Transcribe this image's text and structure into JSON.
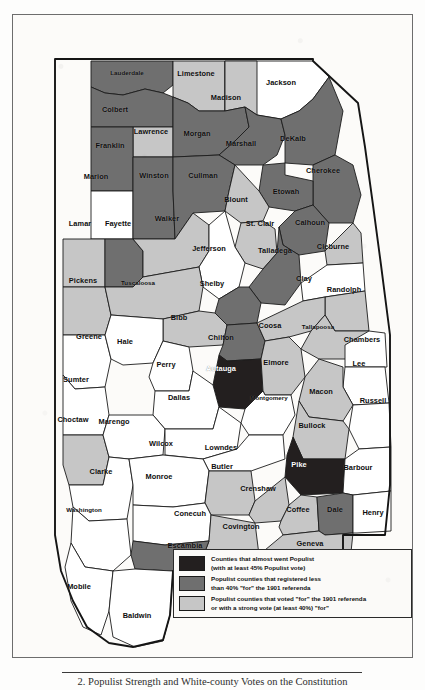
{
  "figure": {
    "caption": "2. Populist Strength and White-county Votes on the Constitution",
    "map_title": "Alabama counties — Populist strength and 1901 referenda"
  },
  "colors": {
    "almost_populist": "#231f1f",
    "populist_low_for": "#6f6f6f",
    "populist_voted_for": "#c6c6c6",
    "no_category": "#ffffff",
    "border": "#1c1c1c",
    "page_background": "#fdfdfc",
    "plate_background": "#fcfbf9"
  },
  "legend": {
    "items": [
      {
        "swatch": "almost_populist",
        "line1": "Counties that almost went Populist",
        "line2": "(with at least 45% Populist vote)"
      },
      {
        "swatch": "populist_low_for",
        "line1": "Populist counties that registered less",
        "line2": "than 40% \"for\" the 1901 referenda"
      },
      {
        "swatch": "populist_voted_for",
        "line1": "Populist counties that voted \"for\" the 1901 referenda",
        "line2": "or with a strong vote (at least 40%) \"for\""
      }
    ]
  },
  "counties": [
    {
      "name": "Lauderdale",
      "category": "populist_low_for",
      "lx": 114,
      "ly": 57
    },
    {
      "name": "Limestone",
      "category": "populist_voted_for",
      "lx": 183,
      "ly": 58
    },
    {
      "name": "Jackson",
      "category": "no_category",
      "lx": 268,
      "ly": 67
    },
    {
      "name": "Madison",
      "category": "populist_voted_for",
      "lx": 213,
      "ly": 82
    },
    {
      "name": "Colbert",
      "category": "populist_low_for",
      "lx": 102,
      "ly": 94
    },
    {
      "name": "Lawrence",
      "category": "populist_voted_for",
      "lx": 138,
      "ly": 116
    },
    {
      "name": "Morgan",
      "category": "populist_low_for",
      "lx": 184,
      "ly": 118
    },
    {
      "name": "Marshall",
      "category": "populist_low_for",
      "lx": 228,
      "ly": 128
    },
    {
      "name": "DeKalb",
      "category": "populist_low_for",
      "lx": 280,
      "ly": 123
    },
    {
      "name": "Franklin",
      "category": "populist_low_for",
      "lx": 97,
      "ly": 130
    },
    {
      "name": "Marion",
      "category": "no_category",
      "lx": 83,
      "ly": 161
    },
    {
      "name": "Winston",
      "category": "populist_low_for",
      "lx": 141,
      "ly": 160
    },
    {
      "name": "Cullman",
      "category": "populist_low_for",
      "lx": 190,
      "ly": 160
    },
    {
      "name": "Cherokee",
      "category": "populist_low_for",
      "lx": 310,
      "ly": 155
    },
    {
      "name": "Etowah",
      "category": "populist_low_for",
      "lx": 273,
      "ly": 176
    },
    {
      "name": "Blount",
      "category": "populist_voted_for",
      "lx": 223,
      "ly": 184
    },
    {
      "name": "Lamar",
      "category": "populist_voted_for",
      "lx": 67,
      "ly": 208
    },
    {
      "name": "Fayette",
      "category": "populist_low_for",
      "lx": 105,
      "ly": 208
    },
    {
      "name": "Walker",
      "category": "populist_voted_for",
      "lx": 154,
      "ly": 203
    },
    {
      "name": "St. Clair",
      "category": "populist_voted_for",
      "lx": 247,
      "ly": 208
    },
    {
      "name": "Calhoun",
      "category": "populist_low_for",
      "lx": 297,
      "ly": 207
    },
    {
      "name": "Jefferson",
      "category": "no_category",
      "lx": 196,
      "ly": 233
    },
    {
      "name": "Talladega",
      "category": "populist_low_for",
      "lx": 262,
      "ly": 235
    },
    {
      "name": "Cleburne",
      "category": "populist_voted_for",
      "lx": 320,
      "ly": 231
    },
    {
      "name": "Pickens",
      "category": "populist_voted_for",
      "lx": 70,
      "ly": 265
    },
    {
      "name": "Tuscaloosa",
      "category": "populist_voted_for",
      "lx": 125,
      "ly": 267
    },
    {
      "name": "Shelby",
      "category": "populist_low_for",
      "lx": 199,
      "ly": 268
    },
    {
      "name": "Clay",
      "category": "no_category",
      "lx": 291,
      "ly": 263
    },
    {
      "name": "Randolph",
      "category": "populist_voted_for",
      "lx": 331,
      "ly": 274
    },
    {
      "name": "Bibb",
      "category": "populist_voted_for",
      "lx": 166,
      "ly": 302
    },
    {
      "name": "Greene",
      "category": "no_category",
      "lx": 76,
      "ly": 321
    },
    {
      "name": "Hale",
      "category": "no_category",
      "lx": 112,
      "ly": 326
    },
    {
      "name": "Chilton",
      "category": "populist_low_for",
      "lx": 208,
      "ly": 322
    },
    {
      "name": "Coosa",
      "category": "populist_voted_for",
      "lx": 257,
      "ly": 310
    },
    {
      "name": "Tallapoosa",
      "category": "populist_voted_for",
      "lx": 305,
      "ly": 311
    },
    {
      "name": "Chambers",
      "category": "no_category",
      "lx": 349,
      "ly": 324
    },
    {
      "name": "Sumter",
      "category": "no_category",
      "lx": 63,
      "ly": 364
    },
    {
      "name": "Perry",
      "category": "no_category",
      "lx": 153,
      "ly": 349
    },
    {
      "name": "Autauga",
      "category": "almost_populist",
      "lx": 208,
      "ly": 353
    },
    {
      "name": "Elmore",
      "category": "populist_voted_for",
      "lx": 263,
      "ly": 347
    },
    {
      "name": "Lee",
      "category": "no_category",
      "lx": 346,
      "ly": 348
    },
    {
      "name": "Dallas",
      "category": "no_category",
      "lx": 166,
      "ly": 382
    },
    {
      "name": "Montgomery",
      "category": "no_category",
      "lx": 256,
      "ly": 382
    },
    {
      "name": "Macon",
      "category": "populist_voted_for",
      "lx": 308,
      "ly": 376
    },
    {
      "name": "Russell",
      "category": "no_category",
      "lx": 360,
      "ly": 385
    },
    {
      "name": "Choctaw",
      "category": "populist_voted_for",
      "lx": 60,
      "ly": 404
    },
    {
      "name": "Marengo",
      "category": "no_category",
      "lx": 101,
      "ly": 406
    },
    {
      "name": "Wilcox",
      "category": "no_category",
      "lx": 148,
      "ly": 428
    },
    {
      "name": "Lowndes",
      "category": "no_category",
      "lx": 208,
      "ly": 432
    },
    {
      "name": "Bullock",
      "category": "populist_voted_for",
      "lx": 299,
      "ly": 410
    },
    {
      "name": "Clarke",
      "category": "no_category",
      "lx": 88,
      "ly": 456
    },
    {
      "name": "Monroe",
      "category": "no_category",
      "lx": 146,
      "ly": 461
    },
    {
      "name": "Butler",
      "category": "populist_voted_for",
      "lx": 209,
      "ly": 451
    },
    {
      "name": "Pike",
      "category": "almost_populist",
      "lx": 286,
      "ly": 449
    },
    {
      "name": "Barbour",
      "category": "no_category",
      "lx": 345,
      "ly": 452
    },
    {
      "name": "Crenshaw",
      "category": "populist_voted_for",
      "lx": 245,
      "ly": 473
    },
    {
      "name": "Washington",
      "category": "no_category",
      "lx": 71,
      "ly": 494
    },
    {
      "name": "Conecuh",
      "category": "no_category",
      "lx": 177,
      "ly": 498
    },
    {
      "name": "Covington",
      "category": "populist_voted_for",
      "lx": 228,
      "ly": 511
    },
    {
      "name": "Coffee",
      "category": "populist_voted_for",
      "lx": 285,
      "ly": 494
    },
    {
      "name": "Dale",
      "category": "populist_low_for",
      "lx": 322,
      "ly": 494
    },
    {
      "name": "Henry",
      "category": "no_category",
      "lx": 360,
      "ly": 497
    },
    {
      "name": "Escambia",
      "category": "populist_low_for",
      "lx": 172,
      "ly": 530
    },
    {
      "name": "Geneva",
      "category": "populist_voted_for",
      "lx": 297,
      "ly": 528
    },
    {
      "name": "Mobile",
      "category": "no_category",
      "lx": 66,
      "ly": 571
    },
    {
      "name": "Baldwin",
      "category": "no_category",
      "lx": 124,
      "ly": 600
    }
  ]
}
